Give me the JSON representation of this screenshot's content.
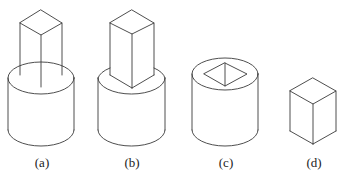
{
  "figure": {
    "panels": [
      {
        "id": "a",
        "label": "(a)",
        "description": "Square prism inserted into cylinder, prism edges visible inside top of cylinder"
      },
      {
        "id": "b",
        "label": "(b)",
        "description": "Square prism standing on top of cylinder"
      },
      {
        "id": "c",
        "label": "(c)",
        "description": "Cylinder with square hole cut through the top"
      },
      {
        "id": "d",
        "label": "(d)",
        "description": "Square prism (rectangular block) alone"
      }
    ],
    "line_color": "#3a3a3a",
    "background": "#ffffff"
  }
}
